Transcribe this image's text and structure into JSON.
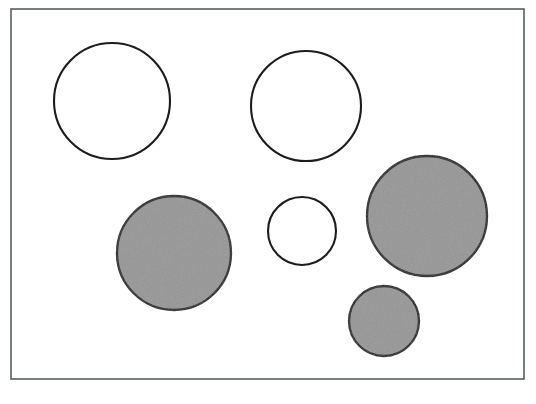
{
  "figure": {
    "canvas": {
      "width": 536,
      "height": 404,
      "background": "#ffffff"
    },
    "frame": {
      "label": "rectangular-border",
      "x": 11,
      "y": 9,
      "width": 513,
      "height": 370,
      "stroke": "#555f5f",
      "stroke_width": 1.6,
      "fill": "none"
    },
    "palette": {
      "gray_fill": "#969696",
      "outline": "#1c1c1c",
      "white_fill": "#ffffff",
      "frame_stroke": "#555f5f",
      "page_background": "#ffffff"
    },
    "legend": {
      "shaded_label": "shaded circle",
      "unshaded_label": "unshaded circle"
    },
    "counts": {
      "total": 6,
      "shaded": 3,
      "unshaded": 3
    }
  },
  "chart_data": {
    "type": "scatter",
    "subtitle": "",
    "xlabel": "",
    "ylabel": "",
    "xlim": [
      11,
      524
    ],
    "ylim": [
      9,
      379
    ],
    "grid": false,
    "legend_position": "none",
    "annotations": [],
    "series": [
      {
        "name": "unshaded circle",
        "fill": "#ffffff",
        "stroke": "#1c1c1c",
        "values": [
          {
            "id": "circle-1",
            "cx": 112,
            "cy": 101,
            "r": 58,
            "diameter": 116,
            "fill_state": "unshaded",
            "size_class": "large"
          },
          {
            "id": "circle-2",
            "cx": 306,
            "cy": 106,
            "r": 55,
            "diameter": 110,
            "fill_state": "unshaded",
            "size_class": "large"
          },
          {
            "id": "circle-4",
            "cx": 302,
            "cy": 231,
            "r": 34,
            "diameter": 68,
            "fill_state": "unshaded",
            "size_class": "small"
          }
        ]
      },
      {
        "name": "shaded circle",
        "fill": "#969696",
        "stroke": "#1c1c1c",
        "values": [
          {
            "id": "circle-3",
            "cx": 174,
            "cy": 253,
            "r": 57,
            "diameter": 114,
            "fill_state": "shaded",
            "size_class": "large"
          },
          {
            "id": "circle-5",
            "cx": 427,
            "cy": 216,
            "r": 60,
            "diameter": 120,
            "fill_state": "shaded",
            "size_class": "large"
          },
          {
            "id": "circle-6",
            "cx": 384,
            "cy": 321,
            "r": 35,
            "diameter": 70,
            "fill_state": "shaded",
            "size_class": "small"
          }
        ]
      }
    ]
  }
}
